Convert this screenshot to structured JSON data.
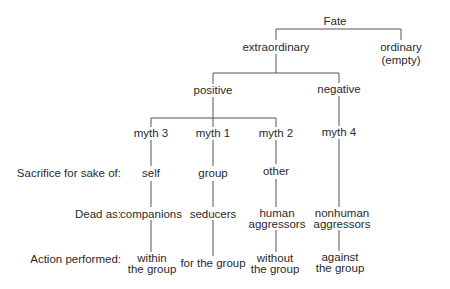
{
  "diagram": {
    "root": {
      "label": "Fate"
    },
    "level1": [
      {
        "label": "extraordinary"
      },
      {
        "label": "ordinary",
        "sublabel": "(empty)"
      }
    ],
    "level2": [
      {
        "label": "positive"
      },
      {
        "label": "negative"
      }
    ],
    "myths": [
      {
        "label": "myth 3",
        "sacrifice": "self",
        "dead_as": "companions",
        "dead_as_2": "",
        "action": "within",
        "action_2": "the group"
      },
      {
        "label": "myth 1",
        "sacrifice": "group",
        "dead_as": "seducers",
        "dead_as_2": "",
        "action": "for the group",
        "action_2": ""
      },
      {
        "label": "myth 2",
        "sacrifice": "other",
        "dead_as": "human",
        "dead_as_2": "aggressors",
        "action": "without",
        "action_2": "the group"
      },
      {
        "label": "myth 4",
        "sacrifice": "",
        "dead_as": "nonhuman",
        "dead_as_2": "aggressors",
        "action": "against",
        "action_2": "the group"
      }
    ],
    "row_labels": {
      "sacrifice": "Sacrifice for sake of:",
      "dead_as": "Dead as:",
      "action": "Action performed:"
    }
  }
}
